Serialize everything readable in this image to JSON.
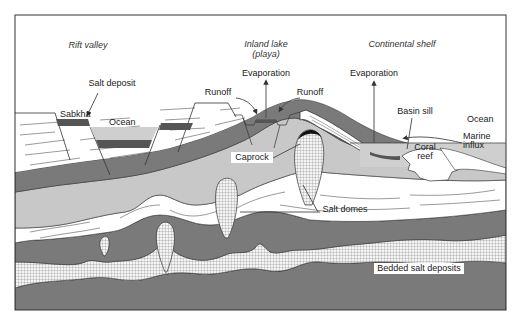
{
  "diagram": {
    "title_regions": {
      "rift_valley": "Rift valley",
      "inland_lake_line1": "Inland lake",
      "inland_lake_line2": "(playa)",
      "continental_shelf": "Continental shelf"
    },
    "labels": {
      "salt_deposit": "Salt deposit",
      "sabkha": "Sabkha",
      "ocean_left": "Ocean",
      "runoff_left": "Runoff",
      "evaporation_lake": "Evaporation",
      "runoff_right": "Runoff",
      "evaporation_shelf": "Evaporation",
      "basin_sill": "Basin sill",
      "ocean_right": "Ocean",
      "marine_influx_line1": "Marine",
      "marine_influx_line2": "influx",
      "coral_reef_line1": "Coral",
      "coral_reef_line2": "reef",
      "caprock": "Caprock",
      "salt_domes": "Salt domes",
      "bedded_salt_deposits": "Bedded salt deposits"
    },
    "colors": {
      "frame": "#333333",
      "dark_layer": "#7a7a7a",
      "mid_layer": "#9a9a9a",
      "light_layer": "#c8c8c8",
      "ocean_water": "#cfcfcf",
      "salt_band": "#555555",
      "sediment_white": "#ffffff",
      "salt_grid": "#888888"
    }
  }
}
